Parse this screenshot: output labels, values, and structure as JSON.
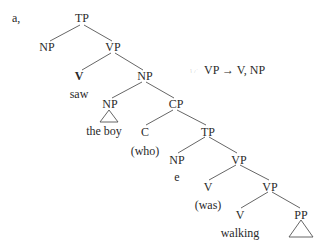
{
  "example_label": "a,",
  "rule": {
    "icon": "☞",
    "text": "VP → V, NP"
  },
  "nodes": {
    "tp1": "TP",
    "np_subj": "NP",
    "vp1": "VP",
    "v1": "V",
    "saw": "saw",
    "np_obj": "NP",
    "np_boy": "NP",
    "the_boy": "the boy",
    "cp": "CP",
    "c": "C",
    "who": "(who)",
    "tp2": "TP",
    "np_e": "NP",
    "e": "e",
    "vp2": "VP",
    "v2": "V",
    "was": "(was)",
    "vp3": "VP",
    "v3": "V",
    "walking": "walking",
    "pp": "PP"
  }
}
